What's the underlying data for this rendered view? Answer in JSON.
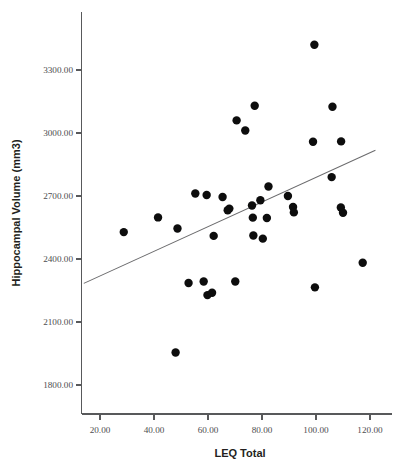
{
  "chart_data": {
    "type": "scatter",
    "title": "",
    "xlabel": "LEQ Total",
    "ylabel": "Hippocampal Volume (mm3)",
    "xlim": [
      14,
      126
    ],
    "ylim": [
      1650,
      3480
    ],
    "grid": false,
    "legend": null,
    "xticks": [
      20,
      40,
      60,
      80,
      100,
      120
    ],
    "xtick_labels": [
      "20.00",
      "40.00",
      "60.00",
      "80.00",
      "100.00",
      "120.00"
    ],
    "yticks": [
      1800,
      2100,
      2400,
      2700,
      3000,
      3300
    ],
    "ytick_labels": [
      "1800.00",
      "2100.00",
      "2400.00",
      "2700.00",
      "3000.00",
      "3300.00"
    ],
    "marker": "filled-circle",
    "marker_color": "#0d0d0d",
    "marker_size": 6,
    "points": [
      {
        "x": 28.8,
        "y": 2528
      },
      {
        "x": 41.5,
        "y": 2598
      },
      {
        "x": 48.0,
        "y": 1955
      },
      {
        "x": 48.7,
        "y": 2545
      },
      {
        "x": 52.8,
        "y": 2286
      },
      {
        "x": 55.3,
        "y": 2712
      },
      {
        "x": 58.4,
        "y": 2293
      },
      {
        "x": 59.5,
        "y": 2705
      },
      {
        "x": 59.8,
        "y": 2228
      },
      {
        "x": 61.5,
        "y": 2239
      },
      {
        "x": 62.1,
        "y": 2510
      },
      {
        "x": 65.4,
        "y": 2695
      },
      {
        "x": 67.3,
        "y": 2632
      },
      {
        "x": 67.9,
        "y": 2640
      },
      {
        "x": 70.1,
        "y": 2293
      },
      {
        "x": 70.6,
        "y": 3060
      },
      {
        "x": 73.8,
        "y": 3012
      },
      {
        "x": 76.3,
        "y": 2655
      },
      {
        "x": 76.6,
        "y": 2597
      },
      {
        "x": 76.8,
        "y": 2512
      },
      {
        "x": 77.3,
        "y": 3130
      },
      {
        "x": 79.4,
        "y": 2680
      },
      {
        "x": 80.3,
        "y": 2497
      },
      {
        "x": 81.8,
        "y": 2595
      },
      {
        "x": 82.4,
        "y": 2745
      },
      {
        "x": 89.6,
        "y": 2700
      },
      {
        "x": 91.5,
        "y": 2648
      },
      {
        "x": 91.8,
        "y": 2622
      },
      {
        "x": 98.9,
        "y": 2958
      },
      {
        "x": 99.4,
        "y": 3420
      },
      {
        "x": 99.6,
        "y": 2265
      },
      {
        "x": 105.8,
        "y": 2790
      },
      {
        "x": 106.1,
        "y": 3125
      },
      {
        "x": 109.3,
        "y": 2960
      },
      {
        "x": 109.2,
        "y": 2645
      },
      {
        "x": 110.0,
        "y": 2620
      },
      {
        "x": 117.3,
        "y": 2382
      }
    ],
    "fit_line": {
      "name": "linear-fit",
      "color": "#6b6b6d",
      "x_start": 14.0,
      "y_start": 2284,
      "x_end": 122.0,
      "y_end": 2918
    }
  },
  "axes": {
    "y_title": "Hippocampal Volume (mm3)",
    "x_title": "LEQ Total"
  }
}
